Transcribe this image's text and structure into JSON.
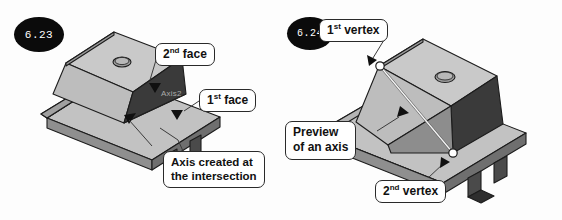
{
  "figures": [
    {
      "id": "6.23",
      "number_label": "6.23",
      "callouts": [
        {
          "name": "second-face",
          "prefix": "2",
          "sup": "nd",
          "text": " face"
        },
        {
          "name": "first-face",
          "prefix": "1",
          "sup": "st",
          "text": " face"
        },
        {
          "name": "axis-created",
          "line1": "Axis created at",
          "line2": "the intersection"
        }
      ],
      "feature_tag": "Axis2"
    },
    {
      "id": "6.24",
      "number_label": "6.24",
      "callouts": [
        {
          "name": "first-vertex",
          "prefix": "1",
          "sup": "st",
          "text": " vertex"
        },
        {
          "name": "preview-axis",
          "line1": "Preview",
          "line2": "of an axis"
        },
        {
          "name": "second-vertex",
          "prefix": "2",
          "sup": "nd",
          "text": " vertex"
        }
      ]
    }
  ],
  "colors": {
    "badge_background": "#0b0b0b",
    "badge_text": "#ffffff",
    "callout_border": "#2a2a2a",
    "callout_text": "#111111",
    "page_background": "#fdfdfd",
    "model_top_face": "#c9c9c9",
    "model_light_face": "#bdbdbd",
    "model_dark_face": "#3a3a3a",
    "model_mid_face": "#9a9a9a",
    "model_outline": "#1c1c1c",
    "feature_tag_text": "#a9a9a9",
    "preview_axis": "#f2f2f2"
  }
}
